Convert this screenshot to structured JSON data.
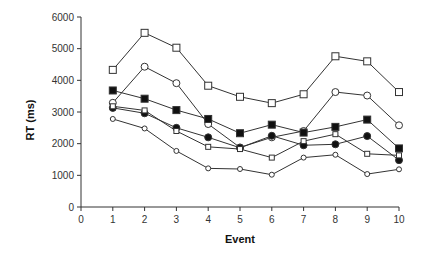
{
  "chart_data": {
    "type": "line",
    "title": "",
    "xlabel": "Event",
    "ylabel": "RT (ms)",
    "xlim": [
      0,
      10
    ],
    "ylim": [
      0,
      6000
    ],
    "x_ticks": [
      0,
      1,
      2,
      3,
      4,
      5,
      6,
      7,
      8,
      9,
      10
    ],
    "y_ticks": [
      0,
      1000,
      2000,
      3000,
      4000,
      5000,
      6000
    ],
    "grid": false,
    "legend": null,
    "x": [
      1,
      2,
      3,
      4,
      5,
      6,
      7,
      8,
      9,
      10
    ],
    "series": [
      {
        "name": "open-square-large",
        "marker": "square",
        "filled": false,
        "size": "large",
        "values": [
          4330,
          5500,
          5030,
          3830,
          3480,
          3280,
          3560,
          4760,
          4600,
          3630
        ]
      },
      {
        "name": "open-circle-large",
        "marker": "circle",
        "filled": false,
        "size": "large",
        "values": [
          3290,
          4430,
          3910,
          2620,
          1880,
          2200,
          2400,
          3630,
          3520,
          2580
        ]
      },
      {
        "name": "filled-square",
        "marker": "square",
        "filled": true,
        "size": "large",
        "values": [
          3680,
          3420,
          3060,
          2780,
          2330,
          2600,
          2350,
          2530,
          2760,
          1850
        ]
      },
      {
        "name": "filled-circle",
        "marker": "circle",
        "filled": true,
        "size": "large",
        "values": [
          3130,
          2960,
          2500,
          2200,
          1870,
          2250,
          1950,
          1980,
          2240,
          1480
        ]
      },
      {
        "name": "open-square-small",
        "marker": "square",
        "filled": false,
        "size": "small",
        "values": [
          3180,
          3050,
          2400,
          1900,
          1830,
          1560,
          2080,
          2300,
          1680,
          1630
        ]
      },
      {
        "name": "open-circle-small",
        "marker": "circle",
        "filled": false,
        "size": "small",
        "values": [
          2780,
          2480,
          1770,
          1220,
          1200,
          1020,
          1560,
          1650,
          1040,
          1190
        ]
      }
    ]
  }
}
